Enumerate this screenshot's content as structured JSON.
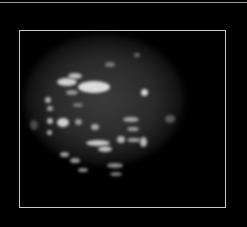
{
  "image": {
    "description": "Grayscale speckled ovoid specimen inside a thin light-gray rectangular frame on black background",
    "background_color": "#000000",
    "frame_color": "#c8c8c8",
    "frame": {
      "x": 19,
      "y": 30,
      "width": 207,
      "height": 178
    },
    "blob": {
      "cx": 104,
      "cy": 100,
      "rx": 80,
      "ry": 65
    },
    "spots": [
      {
        "x": 57,
        "y": 78,
        "w": 20,
        "h": 8,
        "c": "#d0d0d0"
      },
      {
        "x": 78,
        "y": 81,
        "w": 32,
        "h": 12,
        "c": "#dcdcdc"
      },
      {
        "x": 68,
        "y": 73,
        "w": 14,
        "h": 6,
        "c": "#bdbdbd"
      },
      {
        "x": 66,
        "y": 90,
        "w": 12,
        "h": 5,
        "c": "#9a9a9a"
      },
      {
        "x": 141,
        "y": 89,
        "w": 7,
        "h": 7,
        "c": "#d8d8d8"
      },
      {
        "x": 45,
        "y": 97,
        "w": 6,
        "h": 6,
        "c": "#b0b0b0"
      },
      {
        "x": 47,
        "y": 106,
        "w": 6,
        "h": 5,
        "c": "#a8a8a8"
      },
      {
        "x": 57,
        "y": 118,
        "w": 12,
        "h": 9,
        "c": "#cfcfcf"
      },
      {
        "x": 47,
        "y": 118,
        "w": 6,
        "h": 6,
        "c": "#b8b8b8"
      },
      {
        "x": 75,
        "y": 119,
        "w": 7,
        "h": 6,
        "c": "#9c9c9c"
      },
      {
        "x": 91,
        "y": 124,
        "w": 8,
        "h": 6,
        "c": "#aaaaaa"
      },
      {
        "x": 123,
        "y": 117,
        "w": 16,
        "h": 5,
        "c": "#a5a5a5"
      },
      {
        "x": 127,
        "y": 127,
        "w": 12,
        "h": 4,
        "c": "#9f9f9f"
      },
      {
        "x": 47,
        "y": 130,
        "w": 5,
        "h": 5,
        "c": "#b5b5b5"
      },
      {
        "x": 86,
        "y": 140,
        "w": 24,
        "h": 6,
        "c": "#c8c8c8"
      },
      {
        "x": 98,
        "y": 146,
        "w": 14,
        "h": 6,
        "c": "#bebebe"
      },
      {
        "x": 117,
        "y": 136,
        "w": 8,
        "h": 7,
        "c": "#b4b4b4"
      },
      {
        "x": 140,
        "y": 137,
        "w": 7,
        "h": 10,
        "c": "#b8b8b8"
      },
      {
        "x": 127,
        "y": 138,
        "w": 14,
        "h": 4,
        "c": "#a2a2a2"
      },
      {
        "x": 60,
        "y": 152,
        "w": 9,
        "h": 5,
        "c": "#a0a0a0"
      },
      {
        "x": 70,
        "y": 158,
        "w": 10,
        "h": 5,
        "c": "#9c9c9c"
      },
      {
        "x": 78,
        "y": 168,
        "w": 10,
        "h": 4,
        "c": "#8e8e8e"
      },
      {
        "x": 107,
        "y": 163,
        "w": 16,
        "h": 5,
        "c": "#8a8a8a"
      },
      {
        "x": 110,
        "y": 172,
        "w": 12,
        "h": 4,
        "c": "#7a7a7a"
      },
      {
        "x": 73,
        "y": 103,
        "w": 10,
        "h": 4,
        "c": "#7d7d7d"
      },
      {
        "x": 105,
        "y": 62,
        "w": 10,
        "h": 5,
        "c": "#7a7a7a"
      },
      {
        "x": 134,
        "y": 53,
        "w": 6,
        "h": 4,
        "c": "#707070"
      },
      {
        "x": 165,
        "y": 115,
        "w": 10,
        "h": 8,
        "c": "#5a5a5a"
      },
      {
        "x": 30,
        "y": 120,
        "w": 8,
        "h": 10,
        "c": "#4a4a4a"
      }
    ]
  }
}
